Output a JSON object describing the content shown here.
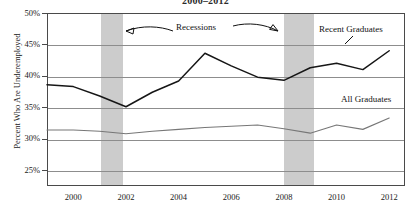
{
  "chart_data": {
    "type": "line",
    "title": "2000–2012",
    "xlabel": "",
    "ylabel": "Percent Who Are Underemployed",
    "xlim": [
      1999,
      2012.6
    ],
    "ylim": [
      22.5,
      50
    ],
    "yticks": [
      "25%",
      "30%",
      "35%",
      "40%",
      "45%",
      "50%"
    ],
    "ytick_values": [
      25,
      30,
      35,
      40,
      45,
      50
    ],
    "xticks": [
      "2000",
      "2002",
      "2004",
      "2006",
      "2008",
      "2010",
      "2012"
    ],
    "xtick_values": [
      2000,
      2002,
      2004,
      2006,
      2008,
      2010,
      2012
    ],
    "grid": "horizontal",
    "legend_position": "inline-annotations",
    "x": [
      1999,
      2000,
      2001,
      2002,
      2003,
      2004,
      2005,
      2006,
      2007,
      2008,
      2009,
      2010,
      2011,
      2012
    ],
    "series": [
      {
        "name": "Recent Graduates",
        "color": "#161616",
        "values": [
          38.6,
          38.3,
          36.8,
          35.1,
          37.4,
          39.2,
          43.6,
          41.6,
          39.8,
          39.3,
          41.3,
          42.0,
          41.0,
          44.0
        ]
      },
      {
        "name": "All Graduates",
        "color": "#777777",
        "values": [
          31.4,
          31.4,
          31.2,
          30.8,
          31.2,
          31.5,
          31.8,
          32.0,
          32.2,
          31.6,
          30.9,
          32.2,
          31.5,
          33.3
        ]
      }
    ],
    "shaded_regions": [
      {
        "label": "Recession",
        "x0": 2001.0,
        "x1": 2001.85
      },
      {
        "label": "Recession",
        "x0": 2007.95,
        "x1": 2009.1
      }
    ],
    "annotations": [
      {
        "name": "recessions",
        "text": "Recessions"
      },
      {
        "name": "recent-graduates",
        "text": "Recent Graduates"
      },
      {
        "name": "all-graduates",
        "text": "All Graduates"
      }
    ]
  }
}
